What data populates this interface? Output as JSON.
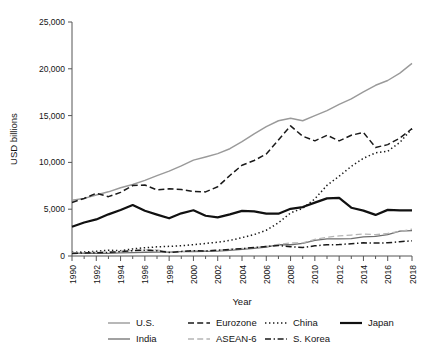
{
  "chart_data": {
    "type": "line",
    "title": "",
    "xlabel": "Year",
    "ylabel": "USD billions",
    "xlim": [
      1990,
      2018
    ],
    "ylim": [
      0,
      25000
    ],
    "yticks": [
      0,
      5000,
      10000,
      15000,
      20000,
      25000
    ],
    "ytick_labels": [
      "0",
      "5,000",
      "10,000",
      "15,000",
      "20,000",
      "25,000"
    ],
    "xticks": [
      1990,
      1992,
      1994,
      1996,
      1998,
      2000,
      2002,
      2004,
      2006,
      2008,
      2010,
      2012,
      2014,
      2016,
      2018
    ],
    "xtick_labels": [
      "1990",
      "1992",
      "1994",
      "1996",
      "1998",
      "2000",
      "2002",
      "2004",
      "2006",
      "2008",
      "2010",
      "2012",
      "2014",
      "2016",
      "2018"
    ],
    "xtick_rotation": 90,
    "grid": false,
    "legend_position": "bottom",
    "x": [
      1990,
      1991,
      1992,
      1993,
      1994,
      1995,
      1996,
      1997,
      1998,
      1999,
      2000,
      2001,
      2002,
      2003,
      2004,
      2005,
      2006,
      2007,
      2008,
      2009,
      2010,
      2011,
      2012,
      2013,
      2014,
      2015,
      2016,
      2017,
      2018
    ],
    "series": [
      {
        "name": "U.S.",
        "color": "#9a9a9a",
        "dash": "solid",
        "width": 1.4,
        "values": [
          5960,
          6160,
          6520,
          6860,
          7290,
          7640,
          8070,
          8580,
          9060,
          9630,
          10250,
          10580,
          10940,
          11460,
          12210,
          13040,
          13820,
          14450,
          14710,
          14450,
          14990,
          15540,
          16200,
          16780,
          17530,
          18240,
          18750,
          19540,
          20580
        ]
      },
      {
        "name": "Eurozone",
        "color": "#1a1a1a",
        "dash": "dashed",
        "width": 1.5,
        "values": [
          5720,
          6150,
          6700,
          6340,
          6800,
          7530,
          7580,
          7060,
          7180,
          7100,
          6900,
          6850,
          7400,
          8600,
          9700,
          10200,
          10900,
          12400,
          13900,
          12800,
          12300,
          12900,
          12300,
          12900,
          13200,
          11600,
          11900,
          12600,
          13600
        ]
      },
      {
        "name": "China",
        "color": "#1a1a1a",
        "dash": "dotted",
        "width": 1.5,
        "values": [
          400,
          420,
          500,
          620,
          570,
          760,
          880,
          980,
          1030,
          1100,
          1210,
          1340,
          1470,
          1660,
          1960,
          2290,
          2750,
          3550,
          4600,
          5100,
          6100,
          7550,
          8530,
          9570,
          10440,
          11020,
          11190,
          12140,
          13600
        ]
      },
      {
        "name": "Japan",
        "color": "#111111",
        "dash": "solid",
        "width": 2.2,
        "values": [
          3130,
          3580,
          3910,
          4450,
          4910,
          5450,
          4830,
          4420,
          4030,
          4560,
          4890,
          4300,
          4120,
          4450,
          4820,
          4760,
          4530,
          4520,
          5040,
          5230,
          5700,
          6160,
          6200,
          5160,
          4850,
          4390,
          4930,
          4870,
          4870
        ]
      },
      {
        "name": "India",
        "color": "#6e6e6e",
        "dash": "solid",
        "width": 1.3,
        "values": [
          320,
          270,
          290,
          280,
          330,
          360,
          400,
          420,
          420,
          460,
          470,
          490,
          520,
          610,
          710,
          830,
          940,
          1220,
          1200,
          1340,
          1680,
          1820,
          1830,
          1860,
          2040,
          2100,
          2290,
          2650,
          2720
        ]
      },
      {
        "name": "ASEAN-6",
        "color": "#b5b5b5",
        "dash": "dashed",
        "width": 1.3,
        "values": [
          330,
          360,
          400,
          440,
          500,
          580,
          650,
          640,
          430,
          490,
          570,
          570,
          620,
          700,
          810,
          900,
          1030,
          1250,
          1400,
          1400,
          1770,
          2000,
          2150,
          2240,
          2350,
          2270,
          2420,
          2640,
          2860
        ]
      },
      {
        "name": "S. Korea",
        "color": "#1a1a1a",
        "dash": "dashdot",
        "width": 1.5,
        "values": [
          280,
          330,
          350,
          390,
          460,
          570,
          620,
          570,
          380,
          490,
          570,
          540,
          620,
          700,
          790,
          900,
          1010,
          1120,
          1000,
          900,
          1090,
          1200,
          1220,
          1310,
          1410,
          1380,
          1410,
          1530,
          1620
        ]
      }
    ],
    "legend_rows": [
      [
        "U.S.",
        "Eurozone",
        "China",
        "Japan"
      ],
      [
        "India",
        "ASEAN-6",
        "S. Korea"
      ]
    ]
  }
}
